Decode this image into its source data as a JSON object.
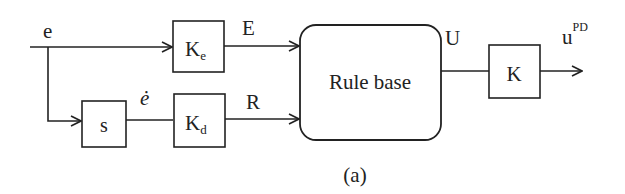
{
  "diagram": {
    "input_signal": "e",
    "derivative_signal": "ė",
    "derivative_block": "s",
    "gain_e": {
      "main": "K",
      "sub": "e"
    },
    "gain_d": {
      "main": "K",
      "sub": "d"
    },
    "signal_E": "E",
    "signal_R": "R",
    "rule_base": "Rule base",
    "signal_U": "U",
    "output_gain": "K",
    "output_signal": {
      "main": "u",
      "sup": "PD"
    },
    "caption": "(a)"
  },
  "colors": {
    "stroke": "#222222",
    "background": "#ffffff"
  }
}
